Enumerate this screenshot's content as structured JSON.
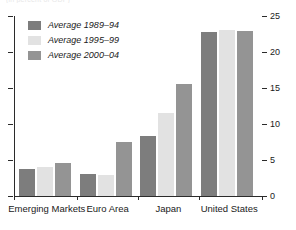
{
  "clipped_title": "(in percent of GDP)",
  "legend": {
    "position": "top-left",
    "entries": [
      {
        "label": "Average 1989–94",
        "color": "#7d7d7d"
      },
      {
        "label": "Average 1995–99",
        "color": "#e2e2e2"
      },
      {
        "label": "Average 2000–04",
        "color": "#949494"
      }
    ]
  },
  "axis": {
    "ticks": [
      0,
      5,
      10,
      15,
      20,
      25
    ],
    "tick_labels": [
      "0",
      "5",
      "10",
      "15",
      "20",
      "25"
    ],
    "label_side": "right",
    "left_ticks_unlabeled": true
  },
  "chart_data": {
    "type": "bar",
    "title": "",
    "xlabel": "",
    "ylabel": "",
    "ylim": [
      0,
      25
    ],
    "grid": false,
    "legend_position": "top-left",
    "categories": [
      "Emerging Markets",
      "Euro Area",
      "Japan",
      "United States"
    ],
    "series": [
      {
        "name": "Average 1989–94",
        "color": "#7d7d7d",
        "values": [
          3.8,
          3.1,
          8.3,
          22.8
        ]
      },
      {
        "name": "Average 1995–99",
        "color": "#e2e2e2",
        "values": [
          4.0,
          2.9,
          11.5,
          23.1
        ]
      },
      {
        "name": "Average 2000–04",
        "color": "#949494",
        "values": [
          4.6,
          7.5,
          15.5,
          22.9
        ]
      }
    ]
  }
}
